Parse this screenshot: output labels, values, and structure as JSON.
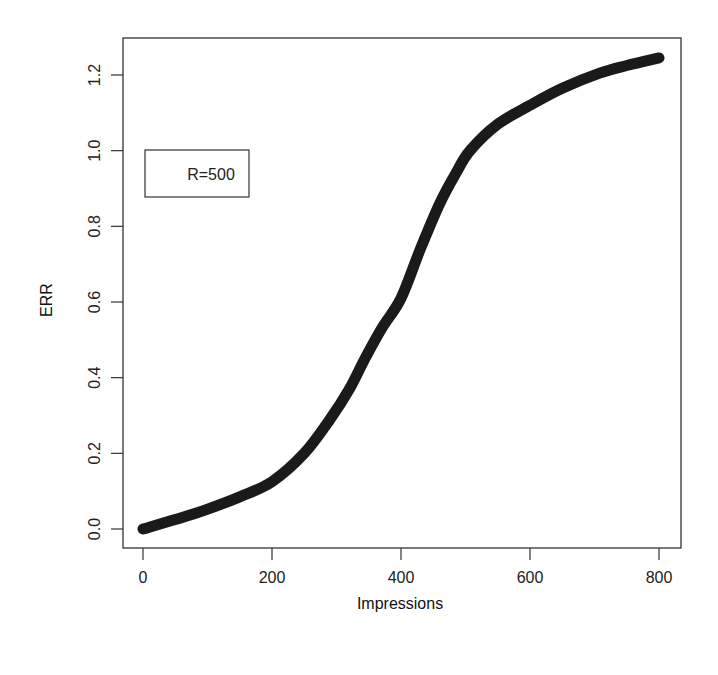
{
  "chart_data": {
    "type": "line",
    "title": "",
    "xlabel": "Impressions",
    "ylabel": "ERR",
    "xlim": [
      -30,
      832
    ],
    "ylim": [
      -0.05,
      1.29
    ],
    "xticks": [
      0,
      200,
      400,
      600,
      800
    ],
    "xtick_labels": [
      "0",
      "200",
      "400",
      "600",
      "800"
    ],
    "yticks": [
      0.0,
      0.2,
      0.4,
      0.6,
      0.8,
      1.0,
      1.2
    ],
    "ytick_labels": [
      "0.0",
      "0.2",
      "0.4",
      "0.6",
      "0.8",
      "1.0",
      "1.2"
    ],
    "grid": false,
    "legend": {
      "position": "upper-left",
      "entries": [
        "R=500"
      ]
    },
    "series": [
      {
        "name": "R=500",
        "color": "#1a1a1a",
        "x": [
          0,
          50,
          96,
          150,
          200,
          250,
          290,
          320,
          344,
          370,
          400,
          430,
          460,
          485,
          507,
          550,
          600,
          650,
          708,
          750,
          800
        ],
        "y": [
          0.0,
          0.025,
          0.05,
          0.085,
          0.125,
          0.2,
          0.29,
          0.37,
          0.45,
          0.53,
          0.61,
          0.74,
          0.86,
          0.94,
          1.0,
          1.07,
          1.12,
          1.165,
          1.205,
          1.225,
          1.245
        ]
      }
    ]
  }
}
